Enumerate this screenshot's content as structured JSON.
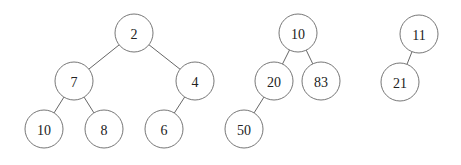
{
  "diagram": {
    "type": "forest-of-trees",
    "node_radius": 19,
    "colors": {
      "background": "#ffffff",
      "edge": "#555555",
      "node_stroke": "#666666",
      "node_fill": "#ffffff",
      "label": "#222222"
    },
    "trees": [
      {
        "root": "2",
        "nodes": [
          {
            "id": "t1n2",
            "label": "2",
            "x": 134,
            "y": 33
          },
          {
            "id": "t1n7",
            "label": "7",
            "x": 74,
            "y": 81
          },
          {
            "id": "t1n4",
            "label": "4",
            "x": 195,
            "y": 81
          },
          {
            "id": "t1n10",
            "label": "10",
            "x": 44,
            "y": 129
          },
          {
            "id": "t1n8",
            "label": "8",
            "x": 104,
            "y": 129
          },
          {
            "id": "t1n6",
            "label": "6",
            "x": 164,
            "y": 129
          }
        ],
        "edges": [
          {
            "from": "t1n2",
            "to": "t1n7"
          },
          {
            "from": "t1n2",
            "to": "t1n4"
          },
          {
            "from": "t1n7",
            "to": "t1n10"
          },
          {
            "from": "t1n7",
            "to": "t1n8"
          },
          {
            "from": "t1n4",
            "to": "t1n6"
          }
        ]
      },
      {
        "root": "10",
        "nodes": [
          {
            "id": "t2n10",
            "label": "10",
            "x": 298,
            "y": 33
          },
          {
            "id": "t2n20",
            "label": "20",
            "x": 274,
            "y": 81
          },
          {
            "id": "t2n83",
            "label": "83",
            "x": 321,
            "y": 81
          },
          {
            "id": "t2n50",
            "label": "50",
            "x": 244,
            "y": 129
          }
        ],
        "edges": [
          {
            "from": "t2n10",
            "to": "t2n20"
          },
          {
            "from": "t2n10",
            "to": "t2n83"
          },
          {
            "from": "t2n20",
            "to": "t2n50"
          }
        ]
      },
      {
        "root": "11",
        "nodes": [
          {
            "id": "t3n11",
            "label": "11",
            "x": 419,
            "y": 34
          },
          {
            "id": "t3n21",
            "label": "21",
            "x": 400,
            "y": 82
          }
        ],
        "edges": [
          {
            "from": "t3n11",
            "to": "t3n21"
          }
        ]
      }
    ]
  }
}
